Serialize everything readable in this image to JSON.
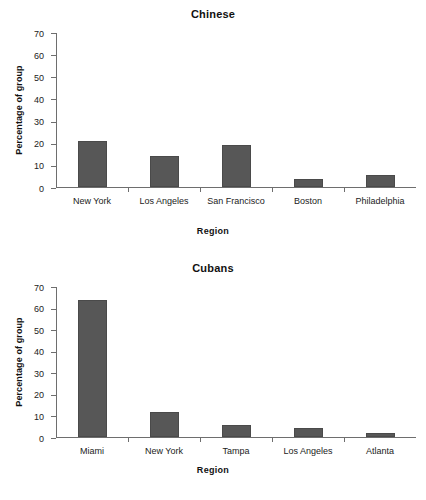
{
  "chart_data": [
    {
      "type": "bar",
      "title": "Chinese",
      "xlabel": "Region",
      "ylabel": "Percentage of group",
      "categories": [
        "New York",
        "Los Angeles",
        "San Francisco",
        "Boston",
        "Philadelphia"
      ],
      "values": [
        21,
        14.2,
        19,
        3.5,
        5.5
      ],
      "yticks": [
        0,
        10,
        20,
        30,
        40,
        50,
        60,
        70
      ],
      "ytick_labels": [
        "0",
        "10",
        "20",
        "30",
        "40",
        "50",
        "60",
        "70"
      ],
      "ylim": [
        0,
        70
      ],
      "grid": false,
      "legend": "none"
    },
    {
      "type": "bar",
      "title": "Cubans",
      "xlabel": "Region",
      "ylabel": "Percentage of group",
      "categories": [
        "Miami",
        "New York",
        "Tampa",
        "Los Angeles",
        "Atlanta"
      ],
      "values": [
        63.3,
        11.5,
        5.4,
        4.2,
        1.7
      ],
      "yticks": [
        0,
        10,
        20,
        30,
        40,
        50,
        60,
        70
      ],
      "ytick_labels": [
        "0",
        "10",
        "20",
        "30",
        "40",
        "50",
        "60",
        "70"
      ],
      "ylim": [
        0,
        70
      ],
      "grid": false,
      "legend": "none"
    }
  ],
  "style": {
    "bar_color": "#575757",
    "axis_color": "#6e6e6e",
    "text_color": "#1a1a1a",
    "background": "#ffffff"
  }
}
